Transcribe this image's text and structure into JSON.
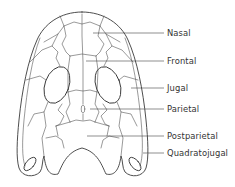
{
  "diagram": {
    "line_color": "#3a3a3a",
    "background": "#ffffff",
    "labels": [
      {
        "id": "nasal",
        "text": "Nasal",
        "y": 33
      },
      {
        "id": "frontal",
        "text": "Frontal",
        "y": 61
      },
      {
        "id": "jugal",
        "text": "Jugal",
        "y": 88
      },
      {
        "id": "parietal",
        "text": "Parietal",
        "y": 109
      },
      {
        "id": "postparietal",
        "text": "Postparietal",
        "y": 136
      },
      {
        "id": "quadratojugal",
        "text": "Quadratojugal",
        "y": 153
      }
    ]
  }
}
